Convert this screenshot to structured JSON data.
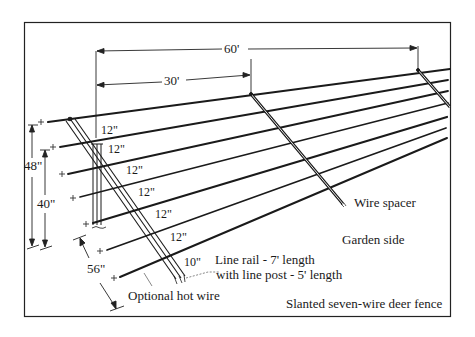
{
  "title": "Slanted seven-wire deer fence",
  "dimensions": {
    "span_60": "60'",
    "span_30": "30'",
    "height_48": "48\"",
    "height_40": "40\"",
    "width_56": "56\"",
    "wire_spacings": [
      "12\"",
      "12\"",
      "12\"",
      "12\"",
      "12\"",
      "12\"",
      "10\""
    ]
  },
  "labels": {
    "line_rail": "Line rail - 7' length",
    "line_post": "with line post - 5' length",
    "hot_wire": "Optional hot wire",
    "wire_spacer": "Wire spacer",
    "garden_side": "Garden side",
    "caption": "Slanted seven-wire deer fence"
  },
  "wire_count": 7,
  "colors": {
    "ink": "#1a1a1a",
    "background": "#ffffff"
  }
}
